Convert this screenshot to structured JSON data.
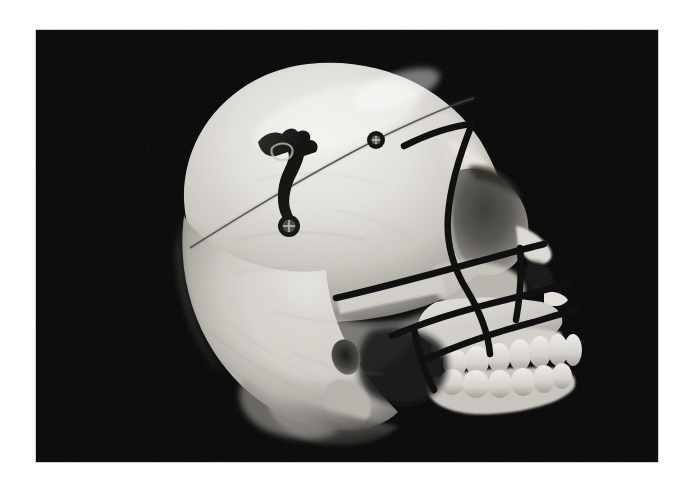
{
  "figure": {
    "caption": "",
    "background_color": "#ffffff",
    "photo_background_color": "#060606",
    "bone_color": "#d9d6d0",
    "marking_color": "#090909",
    "photo_bounds": {
      "left": 36,
      "top": 30,
      "width": 622,
      "height": 432
    }
  },
  "specimen": {
    "subject": "human-skull",
    "view": "lateral",
    "orientation": "facing-right",
    "medium": "black-and-white-photograph"
  },
  "anatomy": {
    "structures": [
      "calvaria",
      "frontal-bone",
      "occipital-bone",
      "temporal-squama",
      "supraorbital-ridge",
      "orbit",
      "nasal-bone",
      "nasal-aperture",
      "anterior-nasal-spine",
      "zygomatic-bone",
      "zygomatic-arch",
      "maxilla",
      "maxillary-alveolus",
      "mandible-body",
      "mandibular-ramus-shadow",
      "external-auditory-meatus",
      "mastoid-process",
      "occipital-base",
      "coronal-suture"
    ],
    "dentition": {
      "upper_tooth_count": 7,
      "lower_tooth_count": 6
    }
  },
  "hardware": {
    "items": [
      {
        "name": "metal-fixation-plate",
        "description": "L-shaped metal distraction / fixation plate",
        "location": "parietal-bone",
        "color": "#0d0d0c"
      },
      {
        "name": "bone-screw",
        "description": "single cortical bone screw head",
        "location": "frontal-bone",
        "color": "#0e0e0d"
      }
    ]
  },
  "markings": {
    "description": "black drawn osteotomy planning lines",
    "color": "#090909",
    "lines": [
      "osteotomy-supraorbital",
      "osteotomy-orbital-vertical",
      "osteotomy-temporozygomatic",
      "osteotomy-lefort-transverse",
      "osteotomy-alveolar-oblique",
      "osteotomy-maxillary-vertical",
      "osteotomy-posterior-vertical"
    ],
    "line_count": 7
  }
}
